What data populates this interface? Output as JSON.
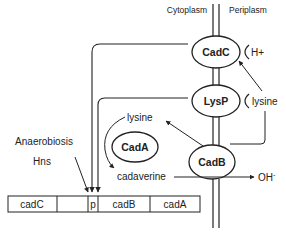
{
  "diagram": {
    "compartments": {
      "left": "Cytoplasm",
      "right": "Periplasm"
    },
    "proteins": {
      "cadc": "CadC",
      "lysp": "LysP",
      "cadb": "CadB",
      "cada": "CadA"
    },
    "signals": {
      "proton": "H+",
      "periplasmic_lysine": "lysine",
      "cytoplasmic_lysine": "lysine",
      "cadaverine": "cadaverine",
      "hydroxide": "OH",
      "hydroxide_charge": "-"
    },
    "regulators": {
      "line1": "Anaerobiosis",
      "line2": "Hns"
    },
    "operon": {
      "segments": [
        {
          "label": "cadC"
        },
        {
          "label": ""
        },
        {
          "label": "p"
        },
        {
          "label": "cadB"
        },
        {
          "label": "cadA"
        }
      ]
    },
    "colors": {
      "stroke": "#222222",
      "background": "#ffffff"
    }
  }
}
